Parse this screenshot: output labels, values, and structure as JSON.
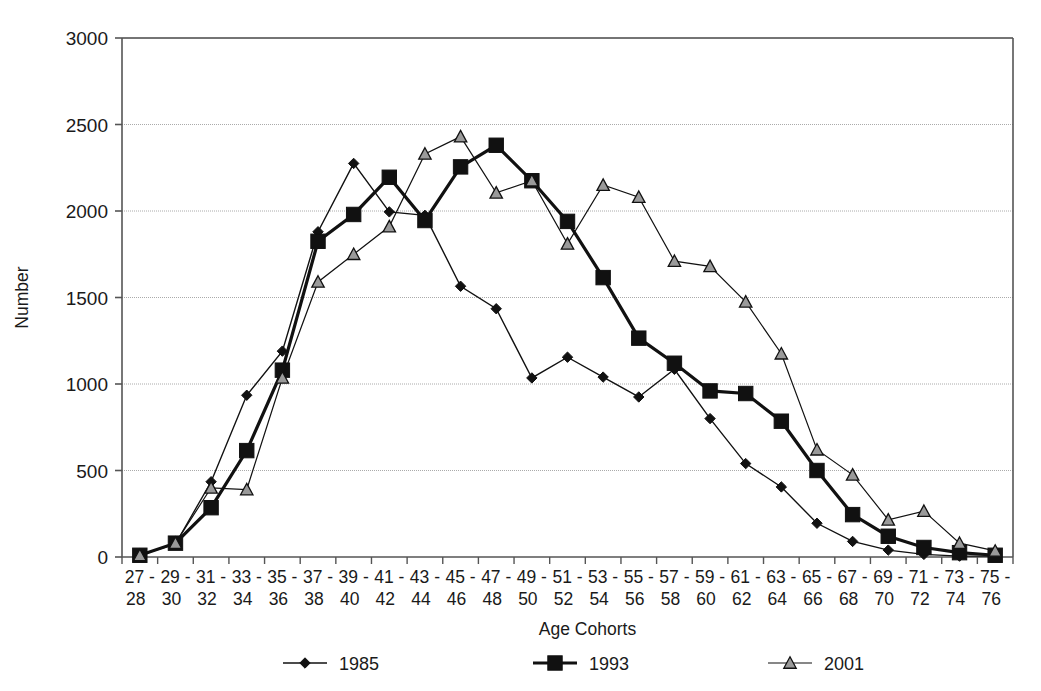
{
  "chart_data": {
    "type": "line",
    "title": "",
    "xlabel": "Age Cohorts",
    "ylabel": "Number",
    "ylim": [
      0,
      3000
    ],
    "yticks": [
      0,
      500,
      1000,
      1500,
      2000,
      2500,
      3000
    ],
    "grid": true,
    "legend_position": "bottom",
    "categories": [
      "27 - 28",
      "29 - 30",
      "31 - 32",
      "33 - 34",
      "35 - 36",
      "37 - 38",
      "39 - 40",
      "41 - 42",
      "43 - 44",
      "45 - 46",
      "47 - 48",
      "49 - 50",
      "51 - 52",
      "53 - 54",
      "55 - 56",
      "57 - 58",
      "59 - 60",
      "61 - 62",
      "63 - 64",
      "65 - 66",
      "67 - 68",
      "69 - 70",
      "71 - 72",
      "73 - 74",
      "75 - 76"
    ],
    "categories_top": [
      "27 -",
      "29 -",
      "31 -",
      "33 -",
      "35 -",
      "37 -",
      "39 -",
      "41 -",
      "43 -",
      "45 -",
      "47 -",
      "49 -",
      "51 -",
      "53 -",
      "55 -",
      "57 -",
      "59 -",
      "61 -",
      "63 -",
      "65 -",
      "67 -",
      "69 -",
      "71 -",
      "73 -",
      "75 -"
    ],
    "categories_bottom": [
      "28",
      "30",
      "32",
      "34",
      "36",
      "38",
      "40",
      "42",
      "44",
      "46",
      "48",
      "50",
      "52",
      "54",
      "56",
      "58",
      "60",
      "62",
      "64",
      "66",
      "68",
      "70",
      "72",
      "74",
      "76"
    ],
    "series": [
      {
        "name": "1985",
        "marker": "diamond",
        "marker_fill": "#111111",
        "line_color": "#111111",
        "line_width": 1.4,
        "values": [
          10,
          75,
          435,
          935,
          1190,
          1880,
          2275,
          1995,
          1975,
          1565,
          1435,
          1035,
          1155,
          1040,
          925,
          1085,
          800,
          540,
          405,
          195,
          90,
          40,
          15,
          5,
          5
        ]
      },
      {
        "name": "1993",
        "marker": "square",
        "marker_fill": "#111111",
        "line_color": "#111111",
        "line_width": 3.2,
        "values": [
          10,
          80,
          285,
          615,
          1080,
          1825,
          1980,
          2195,
          1945,
          2255,
          2380,
          2175,
          1940,
          1615,
          1265,
          1120,
          960,
          945,
          785,
          500,
          245,
          120,
          55,
          25,
          10
        ]
      },
      {
        "name": "2001",
        "marker": "triangle",
        "marker_fill": "#9a9a9a",
        "line_color": "#111111",
        "line_width": 1.2,
        "values": [
          10,
          80,
          400,
          390,
          1035,
          1590,
          1750,
          1910,
          2330,
          2430,
          2105,
          2175,
          1810,
          2150,
          2080,
          1710,
          1680,
          1475,
          1175,
          620,
          475,
          215,
          265,
          80,
          35
        ]
      }
    ],
    "legend": [
      {
        "label": "1985",
        "marker": "diamond"
      },
      {
        "label": "1993",
        "marker": "square"
      },
      {
        "label": "2001",
        "marker": "triangle"
      }
    ]
  },
  "colors": {
    "background": "#ffffff",
    "frame": "#555555",
    "gridline": "#aaaaaa",
    "text": "#1a1a1a",
    "series_line": "#111111",
    "triangle_fill": "#9a9a9a"
  },
  "layout": {
    "plot_left": 122,
    "plot_right": 1013,
    "plot_top": 38,
    "plot_bottom": 557
  }
}
